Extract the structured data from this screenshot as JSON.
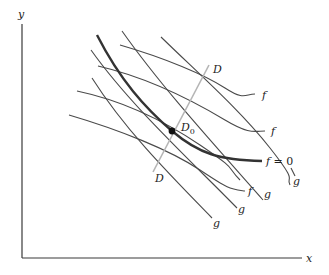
{
  "axes": {
    "x_label": "x",
    "y_label": "y"
  },
  "curves": {
    "f_zero_label": "f = 0",
    "f_label": "f",
    "g_label": "g",
    "f_count": 4,
    "g_count": 4
  },
  "line_D": {
    "label_top": "D",
    "label_bottom": "D"
  },
  "point": {
    "label": "D",
    "subscript": "0"
  },
  "colors": {
    "curve": "#4a4a4a",
    "f_zero": "#333333",
    "line_D": "#b5b5b5",
    "point": "#111111"
  }
}
